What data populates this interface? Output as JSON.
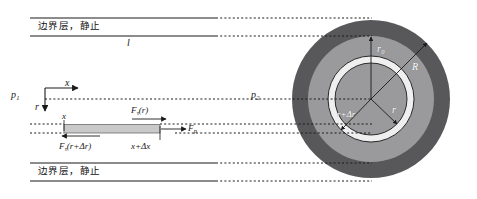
{
  "figure": {
    "title_internal": "pipe-flow-boundary-layer-diagram",
    "colors": {
      "outer_ring": "#58585a",
      "mid_region": "#9a9a9c",
      "inner_annulus": "#d4d4d4",
      "core": "#9a9a9c",
      "element_fill": "#c9c9c9",
      "line": "#1a1a1a",
      "white_text": "#ffffff"
    }
  },
  "labels": {
    "boundary_layer_top": "边界层，静止",
    "boundary_layer_bottom": "边界层，静止",
    "length": "l",
    "pressure_in": "p",
    "pressure_in_sub": "1",
    "pressure_out": "p",
    "pressure_out_sub": "2",
    "axis_x": "x",
    "axis_r": "r",
    "element_x": "x",
    "element_x_dx": "x+Δx",
    "force_tau_r": "F",
    "force_tau_r_sub": "τ",
    "force_tau_r_arg": "(r)",
    "force_tau_rdr": "F",
    "force_tau_rdr_sub": "τ",
    "force_tau_rdr_arg": "(r+Δr)",
    "force_p": "F",
    "force_p_sub": "p",
    "radius_r0": "r",
    "radius_r0_sub": "0",
    "radius_R": "R",
    "radius_r": "r",
    "radius_r_dr": "r+Δr"
  },
  "geometry": {
    "circle_center_x": 371,
    "circle_center_y": 99,
    "radius_outer": 79,
    "radius_mid": 63,
    "radius_annulus_outer": 43,
    "radius_annulus_inner": 36,
    "pipe_top_y": 18,
    "pipe_bottom_y": 181,
    "duct_top_y": 36,
    "duct_bottom_y": 163,
    "element_left_x": 64,
    "element_right_x": 160,
    "element_top_y": 124,
    "element_bottom_y": 133
  }
}
